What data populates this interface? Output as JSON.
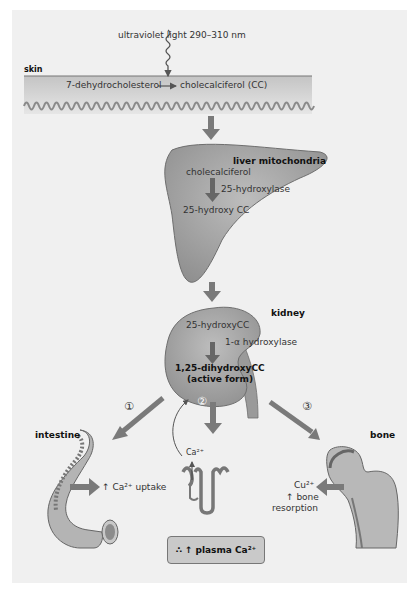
{
  "colors": {
    "panel": "#f0f0f0",
    "organ": "#a8a8a8",
    "arrow": "#7a7a7a",
    "box": "#c9c9c9"
  },
  "uv": {
    "label": "ultraviolet light 290–310 nm"
  },
  "skin": {
    "label": "skin",
    "reactant": "7-dehydrocholesterol",
    "product": "cholecalciferol (CC)"
  },
  "liver": {
    "label": "liver mitochondria",
    "reactant": "cholecalciferol",
    "enzyme": "25-hydroxylase",
    "product": "25-hydroxy CC"
  },
  "kidney": {
    "label": "kidney",
    "reactant": "25-hydroxyCC",
    "enzyme": "1-α hydroxylase",
    "product_line1": "1,25-dihydroxyCC",
    "product_line2": "(active form)"
  },
  "pathways": [
    {
      "number": "①",
      "target": "intestine"
    },
    {
      "number": "②",
      "target": "kidney tubule"
    },
    {
      "number": "③",
      "target": "bone"
    }
  ],
  "intestine": {
    "label": "intestine",
    "effect_arrow": "↑",
    "effect": "Ca²⁺ uptake"
  },
  "tubule": {
    "ion": "Ca²⁺"
  },
  "bone": {
    "label": "bone",
    "ion": "Cu²⁺",
    "effect_line1": "↑ bone",
    "effect_line2": "resorption"
  },
  "result": {
    "therefore": "∴",
    "arrow": "↑",
    "text": "plasma Ca²⁺"
  }
}
